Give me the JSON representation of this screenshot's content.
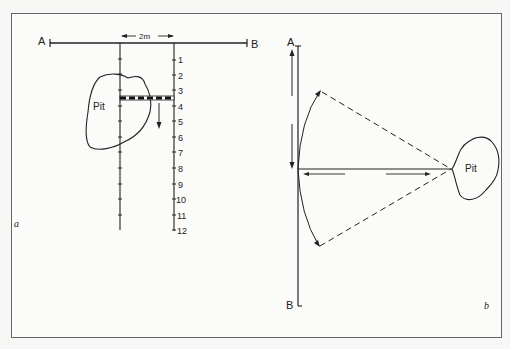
{
  "figure": {
    "panels": [
      {
        "id": "a",
        "label": "a",
        "baseline": {
          "start_label": "A",
          "end_label": "B"
        },
        "spacing_label": "2m",
        "feature_label": "Pit",
        "scale_numbers": [
          "1",
          "2",
          "3",
          "4",
          "5",
          "6",
          "7",
          "8",
          "9",
          "10",
          "11",
          "12"
        ]
      },
      {
        "id": "b",
        "label": "b",
        "baseline": {
          "start_label": "A",
          "end_label": "B"
        },
        "feature_label": "Pit"
      }
    ]
  },
  "colors": {
    "line": "#222222",
    "frame": "#666666",
    "background": "#fbfbf9"
  }
}
